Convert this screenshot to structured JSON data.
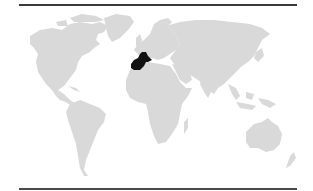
{
  "map": {
    "type": "world-locator-map",
    "projection": "equirectangular-like",
    "colors": {
      "background": "#ffffff",
      "land": "#d9d9d9",
      "highlight": "#111111",
      "rule": "#3a3a3a"
    },
    "highlighted_region": {
      "name": "Spain and France (Iberian Peninsula / Western Europe)",
      "color": "#111111"
    },
    "continents": [
      "North America",
      "Greenland",
      "South America",
      "Europe",
      "Africa",
      "Asia",
      "Australia",
      "New Zealand"
    ]
  }
}
